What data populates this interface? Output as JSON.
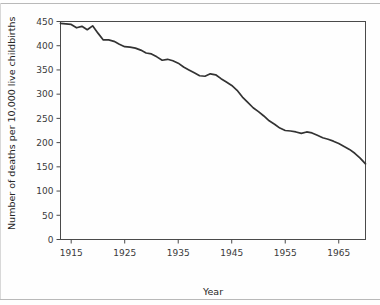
{
  "figure": {
    "background_color": "#fefefe",
    "line_color": "#333333",
    "axis_color": "#4a4a4a",
    "rule_color": "#b9b9b9"
  },
  "chart_data": {
    "type": "line",
    "title": "",
    "xlabel": "Year",
    "ylabel": "Number of deaths per 10,000 live childbirths",
    "xlim": [
      1913,
      1970
    ],
    "ylim": [
      0,
      450
    ],
    "xticks": [
      1915,
      1925,
      1935,
      1945,
      1955,
      1965
    ],
    "xtick_labels": [
      "1915",
      "1925",
      "1935",
      "1945",
      "1955",
      "1965"
    ],
    "yticks": [
      0,
      50,
      100,
      150,
      200,
      250,
      300,
      350,
      400,
      450
    ],
    "ytick_labels": [
      "0",
      "50",
      "100",
      "150",
      "200",
      "250",
      "300",
      "350",
      "400",
      "450"
    ],
    "grid": false,
    "legend": false,
    "series": [
      {
        "name": "Maternal mortality rate",
        "x": [
          1913,
          1915,
          1916,
          1917,
          1918,
          1919,
          1920,
          1921,
          1922,
          1923,
          1924,
          1925,
          1926,
          1927,
          1928,
          1929,
          1930,
          1931,
          1932,
          1933,
          1934,
          1935,
          1936,
          1937,
          1938,
          1939,
          1940,
          1941,
          1942,
          1943,
          1944,
          1945,
          1946,
          1947,
          1948,
          1949,
          1950,
          1951,
          1952,
          1953,
          1954,
          1955,
          1956,
          1957,
          1958,
          1959,
          1960,
          1961,
          1962,
          1963,
          1964,
          1965,
          1966,
          1967,
          1968,
          1969,
          1970
        ],
        "values": [
          446,
          444,
          437,
          440,
          433,
          441,
          426,
          412,
          412,
          409,
          403,
          398,
          397,
          395,
          391,
          385,
          383,
          377,
          370,
          372,
          369,
          364,
          356,
          350,
          344,
          338,
          337,
          342,
          340,
          332,
          325,
          318,
          308,
          294,
          283,
          272,
          264,
          255,
          245,
          238,
          230,
          225,
          224,
          222,
          219,
          222,
          220,
          215,
          210,
          207,
          203,
          198,
          192,
          186,
          178,
          168,
          156
        ]
      }
    ]
  }
}
